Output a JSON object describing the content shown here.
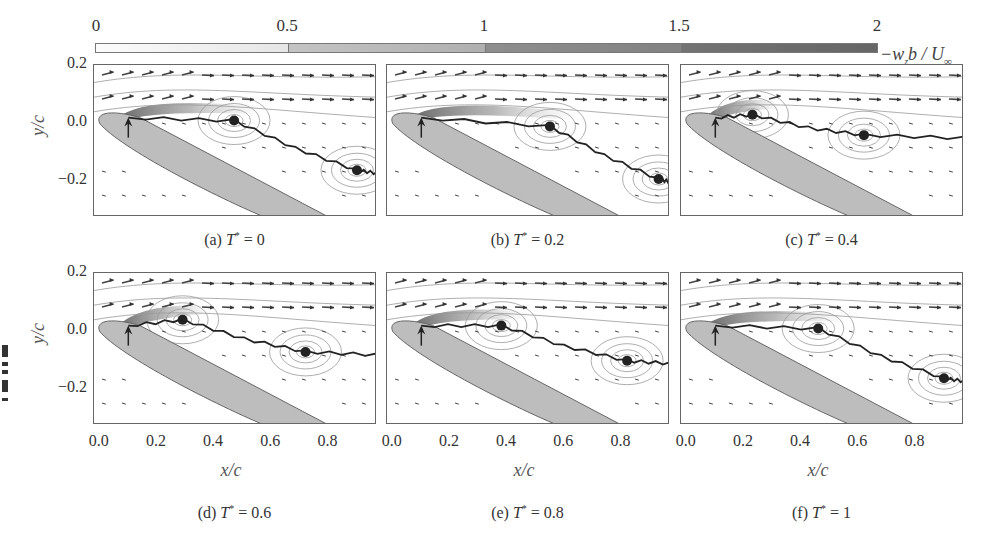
{
  "chart_data": {
    "type": "heatmap",
    "title": "",
    "colorbar": {
      "label": "-w_z b / U_∞",
      "ticks": [
        "0",
        "0.5",
        "1",
        "1.5",
        "2"
      ],
      "range": [
        0,
        2
      ],
      "colors": [
        "#f4f4f4",
        "#bdbdbd",
        "#8f8f8f",
        "#6c6c6c"
      ]
    },
    "xlabel": "x/c",
    "ylabel": "y/c",
    "xlim": [
      -0.02,
      0.97
    ],
    "ylim": [
      -0.32,
      0.2
    ],
    "xticks": [
      "0.0",
      "0.2",
      "0.4",
      "0.6",
      "0.8"
    ],
    "yticks": [
      "0.2",
      "0.0",
      "-0.2"
    ],
    "panels": [
      {
        "id": "a",
        "caption_prefix": "(a) ",
        "T_label": "T",
        "T_value": "= 0",
        "separation_point": [
          0.1,
          0.02
        ],
        "vortex_cores": [
          [
            0.47,
            0.01
          ],
          [
            0.9,
            -0.16
          ]
        ]
      },
      {
        "id": "b",
        "caption_prefix": "(b) ",
        "T_label": "T",
        "T_value": "= 0.2",
        "separation_point": [
          0.1,
          0.02
        ],
        "vortex_cores": [
          [
            0.55,
            -0.01
          ],
          [
            0.93,
            -0.19
          ]
        ]
      },
      {
        "id": "c",
        "caption_prefix": "(c) ",
        "T_label": "T",
        "T_value": "= 0.4",
        "separation_point": [
          0.1,
          0.02
        ],
        "vortex_cores": [
          [
            0.23,
            0.03
          ],
          [
            0.62,
            -0.04
          ]
        ]
      },
      {
        "id": "d",
        "caption_prefix": "(d) ",
        "T_label": "T",
        "T_value": "= 0.6",
        "separation_point": [
          0.1,
          0.02
        ],
        "vortex_cores": [
          [
            0.29,
            0.04
          ],
          [
            0.72,
            -0.07
          ]
        ]
      },
      {
        "id": "e",
        "caption_prefix": "(e) ",
        "T_label": "T",
        "T_value": "= 0.8",
        "separation_point": [
          0.1,
          0.02
        ],
        "vortex_cores": [
          [
            0.38,
            0.02
          ],
          [
            0.82,
            -0.1
          ]
        ]
      },
      {
        "id": "f",
        "caption_prefix": "(f) ",
        "T_label": "T",
        "T_value": "= 1",
        "separation_point": [
          0.1,
          0.02
        ],
        "vortex_cores": [
          [
            0.46,
            0.01
          ],
          [
            0.9,
            -0.16
          ]
        ]
      }
    ],
    "grid": false,
    "legend_position": "top (colorbar)"
  },
  "labels": {
    "ylabel": "y/c",
    "xlabel": "x/c",
    "y_0_2": "0.2",
    "y_0_0": "0.0",
    "y_m0_2": "−0.2",
    "x0": "0.0",
    "x1": "0.2",
    "x2": "0.4",
    "x3": "0.6",
    "x4": "0.8",
    "cb0": "0",
    "cb1": "0.5",
    "cb2": "1",
    "cb3": "1.5",
    "cb4": "2",
    "cb_label": "−w",
    "cb_label_sub": "z",
    "cb_label_rest": "b / U",
    "cb_label_inf": "∞",
    "star": "*"
  }
}
